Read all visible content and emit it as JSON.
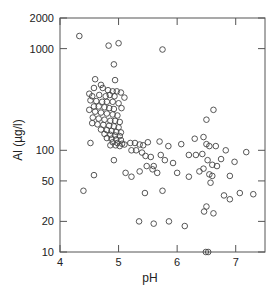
{
  "chart_data": {
    "type": "scatter",
    "title": "",
    "xlabel": "pH",
    "ylabel": "Al (µg/l)",
    "xlim": [
      4,
      7.5
    ],
    "ylim": [
      10,
      2000
    ],
    "yscale": "log",
    "grid": false,
    "legend": null,
    "x_ticks": [
      "4",
      "5",
      "6",
      "7"
    ],
    "y_ticks": [
      "10",
      "20",
      "50",
      "100",
      "1000",
      "2000"
    ],
    "marker": "open-circle",
    "color": "#444444",
    "points": [
      [
        4.33,
        1330
      ],
      [
        4.83,
        1070
      ],
      [
        5.0,
        1130
      ],
      [
        5.75,
        980
      ],
      [
        4.92,
        700
      ],
      [
        4.6,
        500
      ],
      [
        4.94,
        490
      ],
      [
        4.7,
        440
      ],
      [
        4.58,
        410
      ],
      [
        4.73,
        410
      ],
      [
        4.82,
        390
      ],
      [
        4.9,
        380
      ],
      [
        4.97,
        380
      ],
      [
        5.04,
        370
      ],
      [
        4.5,
        360
      ],
      [
        4.55,
        340
      ],
      [
        4.67,
        350
      ],
      [
        4.78,
        340
      ],
      [
        4.85,
        350
      ],
      [
        4.93,
        340
      ],
      [
        5.1,
        330
      ],
      [
        4.52,
        310
      ],
      [
        4.62,
        305
      ],
      [
        4.72,
        300
      ],
      [
        4.8,
        300
      ],
      [
        4.9,
        300
      ],
      [
        5.0,
        290
      ],
      [
        4.58,
        270
      ],
      [
        4.66,
        270
      ],
      [
        4.76,
        265
      ],
      [
        4.84,
        260
      ],
      [
        4.92,
        255
      ],
      [
        5.05,
        260
      ],
      [
        4.5,
        250
      ],
      [
        4.6,
        240
      ],
      [
        4.7,
        235
      ],
      [
        4.8,
        230
      ],
      [
        4.9,
        225
      ],
      [
        4.98,
        220
      ],
      [
        4.56,
        210
      ],
      [
        4.66,
        205
      ],
      [
        4.76,
        200
      ],
      [
        4.86,
        195
      ],
      [
        4.94,
        195
      ],
      [
        5.02,
        190
      ],
      [
        4.55,
        185
      ],
      [
        4.64,
        180
      ],
      [
        4.74,
        178
      ],
      [
        4.84,
        175
      ],
      [
        4.92,
        172
      ],
      [
        5.0,
        168
      ],
      [
        4.7,
        160
      ],
      [
        4.8,
        158
      ],
      [
        4.88,
        155
      ],
      [
        4.96,
        152
      ],
      [
        5.04,
        150
      ],
      [
        4.76,
        145
      ],
      [
        4.86,
        142
      ],
      [
        4.94,
        140
      ],
      [
        5.02,
        138
      ],
      [
        4.8,
        132
      ],
      [
        4.88,
        130
      ],
      [
        4.96,
        128
      ],
      [
        5.04,
        126
      ],
      [
        4.9,
        120
      ],
      [
        4.98,
        118
      ],
      [
        5.06,
        116
      ],
      [
        4.95,
        112
      ],
      [
        4.86,
        112
      ],
      [
        5.02,
        110
      ],
      [
        5.1,
        114
      ],
      [
        5.2,
        118
      ],
      [
        5.28,
        118
      ],
      [
        5.36,
        114
      ],
      [
        5.42,
        112
      ],
      [
        5.5,
        120
      ],
      [
        5.7,
        122
      ],
      [
        5.85,
        110
      ],
      [
        6.07,
        115
      ],
      [
        6.3,
        130
      ],
      [
        6.45,
        135
      ],
      [
        6.5,
        115
      ],
      [
        6.55,
        110
      ],
      [
        6.66,
        110
      ],
      [
        6.62,
        250
      ],
      [
        6.5,
        200
      ],
      [
        6.83,
        100
      ],
      [
        7.18,
        96
      ],
      [
        4.52,
        118
      ],
      [
        5.22,
        100
      ],
      [
        5.3,
        100
      ],
      [
        5.4,
        95
      ],
      [
        5.46,
        88
      ],
      [
        5.55,
        86
      ],
      [
        5.72,
        90
      ],
      [
        5.79,
        80
      ],
      [
        5.93,
        75
      ],
      [
        5.48,
        70
      ],
      [
        5.6,
        70
      ],
      [
        6.2,
        90
      ],
      [
        6.32,
        90
      ],
      [
        6.43,
        92
      ],
      [
        6.52,
        80
      ],
      [
        6.6,
        72
      ],
      [
        6.68,
        70
      ],
      [
        6.75,
        82
      ],
      [
        6.98,
        77
      ],
      [
        5.12,
        60
      ],
      [
        5.22,
        55
      ],
      [
        5.36,
        62
      ],
      [
        5.58,
        65
      ],
      [
        5.66,
        60
      ],
      [
        6.38,
        62
      ],
      [
        6.45,
        66
      ],
      [
        6.6,
        56
      ],
      [
        6.55,
        58
      ],
      [
        6.9,
        56
      ],
      [
        7.07,
        38
      ],
      [
        7.3,
        37
      ],
      [
        6.57,
        48
      ],
      [
        6.8,
        36
      ],
      [
        5.45,
        38
      ],
      [
        5.75,
        40
      ],
      [
        6.0,
        60
      ],
      [
        6.2,
        55
      ],
      [
        6.5,
        28
      ],
      [
        6.46,
        25
      ],
      [
        6.9,
        33
      ],
      [
        6.62,
        24
      ],
      [
        4.92,
        80
      ],
      [
        4.58,
        57
      ],
      [
        4.4,
        40
      ],
      [
        5.35,
        20
      ],
      [
        5.6,
        19
      ],
      [
        6.53,
        10
      ],
      [
        6.49,
        10
      ],
      [
        5.86,
        20
      ],
      [
        6.13,
        18
      ]
    ]
  }
}
